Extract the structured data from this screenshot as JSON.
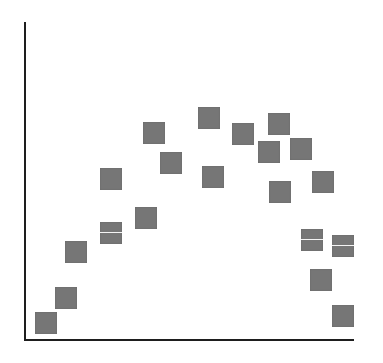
{
  "chart_data": {
    "type": "scatter",
    "title": "",
    "xlabel": "",
    "ylabel": "",
    "xlim": [
      0,
      100
    ],
    "ylim": [
      0,
      100
    ],
    "grid": false,
    "legend": null,
    "marker": {
      "shape": "square",
      "color": "#767676",
      "size_px": 22
    },
    "axis_color": "#1e1e1e",
    "series": [
      {
        "name": "points",
        "points": [
          {
            "x": 6.4,
            "y": 5.3
          },
          {
            "x": 12.4,
            "y": 13.2
          },
          {
            "x": 15.5,
            "y": 27.7
          },
          {
            "x": 26.1,
            "y": 33.6,
            "split": true
          },
          {
            "x": 26.1,
            "y": 50.6
          },
          {
            "x": 36.7,
            "y": 38.4
          },
          {
            "x": 39.1,
            "y": 65.1
          },
          {
            "x": 44.2,
            "y": 55.7
          },
          {
            "x": 55.8,
            "y": 69.8
          },
          {
            "x": 57.0,
            "y": 51.3
          },
          {
            "x": 66.1,
            "y": 64.8
          },
          {
            "x": 73.9,
            "y": 59.1
          },
          {
            "x": 76.9,
            "y": 67.9
          },
          {
            "x": 77.3,
            "y": 46.5
          },
          {
            "x": 83.6,
            "y": 60.1
          },
          {
            "x": 86.9,
            "y": 31.4,
            "split": true
          },
          {
            "x": 90.3,
            "y": 49.7
          },
          {
            "x": 89.7,
            "y": 18.9
          },
          {
            "x": 96.4,
            "y": 29.6,
            "split": true
          },
          {
            "x": 96.4,
            "y": 7.5
          }
        ]
      }
    ]
  }
}
